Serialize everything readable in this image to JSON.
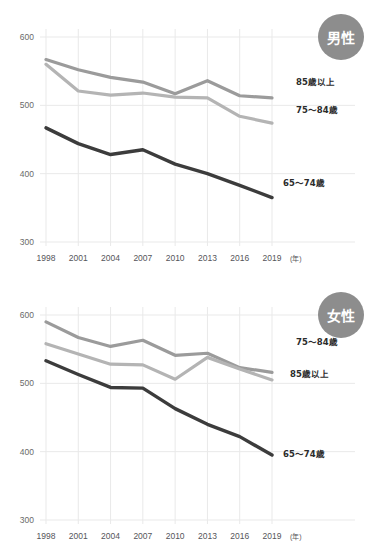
{
  "charts": [
    {
      "badge": "男性",
      "badge_name": "male",
      "chart_data": {
        "type": "line",
        "title": "男性",
        "xlabel": "年",
        "ylabel": "",
        "ylim": [
          300,
          600
        ],
        "yticks": [
          300,
          400,
          500,
          600
        ],
        "grid": true,
        "legend_position": "right-inline",
        "categories": [
          "1998",
          "2001",
          "2004",
          "2007",
          "2010",
          "2013",
          "2016",
          "2019"
        ],
        "x_unit": "(年)",
        "series": [
          {
            "name": "85歳以上",
            "color": "#9b9b9b",
            "label_x": 296,
            "label_y": 85,
            "values": [
              567,
              552,
              541,
              534,
              517,
              536,
              514,
              511
            ]
          },
          {
            "name": "75〜84歳",
            "color": "#b4b4b4",
            "label_x": 296,
            "label_y": 113,
            "values": [
              560,
              521,
              515,
              518,
              512,
              511,
              484,
              474
            ]
          },
          {
            "name": "65〜74歳",
            "color": "#3c3c3c",
            "label_x": 283,
            "label_y": 186,
            "values": [
              467,
              444,
              428,
              435,
              414,
              400,
              383,
              365
            ]
          }
        ]
      }
    },
    {
      "badge": "女性",
      "badge_name": "female",
      "chart_data": {
        "type": "line",
        "title": "女性",
        "xlabel": "年",
        "ylabel": "",
        "ylim": [
          300,
          600
        ],
        "yticks": [
          300,
          400,
          500,
          600
        ],
        "grid": true,
        "legend_position": "right-inline",
        "categories": [
          "1998",
          "2001",
          "2004",
          "2007",
          "2010",
          "2013",
          "2016",
          "2019"
        ],
        "x_unit": "(年)",
        "series": [
          {
            "name": "75〜84歳",
            "color": "#9b9b9b",
            "label_x": 296,
            "label_y": 67,
            "values": [
              590,
              567,
              554,
              563,
              541,
              544,
              523,
              516
            ]
          },
          {
            "name": "85歳以上",
            "color": "#b4b4b4",
            "label_x": 290,
            "label_y": 99,
            "values": [
              558,
              543,
              528,
              527,
              506,
              538,
              521,
              505
            ]
          },
          {
            "name": "65〜74歳",
            "color": "#3c3c3c",
            "label_x": 283,
            "label_y": 179,
            "values": [
              533,
              513,
              494,
              493,
              463,
              440,
              422,
              395
            ]
          }
        ]
      }
    }
  ]
}
